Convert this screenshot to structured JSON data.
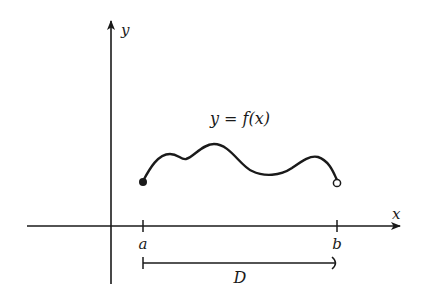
{
  "diagram": {
    "function_label": "y = f(x)",
    "axes": {
      "x_label": "x",
      "y_label": "y"
    },
    "ticks": {
      "a_label": "a",
      "b_label": "b"
    },
    "domain_label": "D",
    "endpoints": {
      "start": "filled (included)",
      "end": "open (excluded)"
    },
    "colors": {
      "ink": "#1a1a1a",
      "background": "#ffffff"
    }
  }
}
